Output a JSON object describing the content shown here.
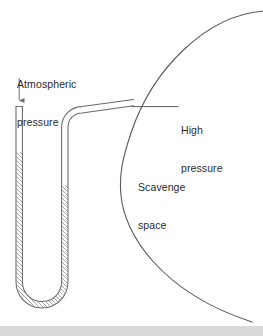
{
  "figure": {
    "background_color": "#ffffff",
    "line_color": "#555555",
    "text_color": "#2b2b2b",
    "footer_band_color": "#d8d9da",
    "width": 263,
    "height": 336
  },
  "labels": {
    "atmospheric_pressure_line1": "Atmospheric",
    "atmospheric_pressure_line2": "pressure",
    "high_pressure_line1": "High",
    "high_pressure_line2": "pressure",
    "scavenge_space_line1": "Scavenge",
    "scavenge_space_line2": "space"
  },
  "elements": {
    "manometer_name": "u-tube-manometer",
    "arrow_name": "atmospheric-pressure-arrow",
    "leader_name": "high-pressure-leader-line",
    "arc_name": "scavenge-space-wall-arc",
    "fluid_name": "manometer-fluid-hatching"
  }
}
